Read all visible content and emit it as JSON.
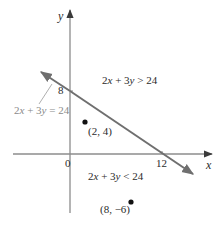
{
  "figure": {
    "axes": {
      "x_label": "x",
      "y_label": "y",
      "origin_label": "0",
      "x_intercept_label": "12",
      "y_intercept_label": "8"
    },
    "boundary_line": {
      "equation_label_parts": [
        "2",
        "x",
        " + 3",
        "y",
        " = 24"
      ],
      "equation": "2x + 3y = 24",
      "x_intercept": [
        12,
        0
      ],
      "y_intercept": [
        0,
        8
      ]
    },
    "regions": {
      "above": {
        "label": "2x + 3y > 24",
        "parts": [
          "2",
          "x",
          " + 3",
          "y",
          " > 24"
        ]
      },
      "below": {
        "label": "2x + 3y < 24",
        "parts": [
          "2",
          "x",
          " + 3",
          "y",
          " < 24"
        ]
      }
    },
    "points": [
      {
        "label": "(2, 4)",
        "x": 2,
        "y": 4
      },
      {
        "label": "(8, −6)",
        "x": 8,
        "y": -6
      }
    ],
    "colors": {
      "axis": "#8c8c8c",
      "line": "#6f6f6f",
      "point": "#111111",
      "text": "#2b2b2b",
      "leader": "#9a9a9a"
    }
  }
}
